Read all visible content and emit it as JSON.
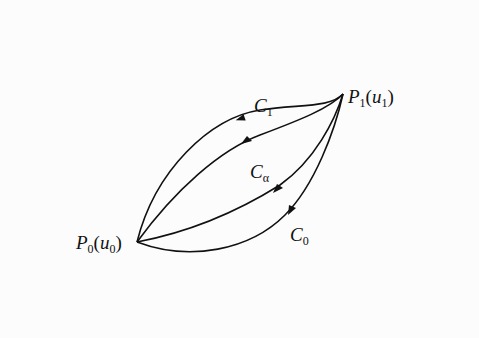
{
  "diagram": {
    "points": {
      "p0": {
        "name": "P",
        "sub": "0",
        "arg": "u",
        "argsub": "0"
      },
      "p1": {
        "name": "P",
        "sub": "1",
        "arg": "u",
        "argsub": "1"
      }
    },
    "curves": [
      {
        "id": "c1",
        "name": "C",
        "sub": "1"
      },
      {
        "id": "calpha",
        "name": "C",
        "sub": "α"
      },
      {
        "id": "cmid",
        "name": "",
        "sub": ""
      },
      {
        "id": "c0",
        "name": "C",
        "sub": "0"
      }
    ],
    "colors": {
      "stroke": "#111111",
      "background": "#fcfcfc"
    }
  }
}
